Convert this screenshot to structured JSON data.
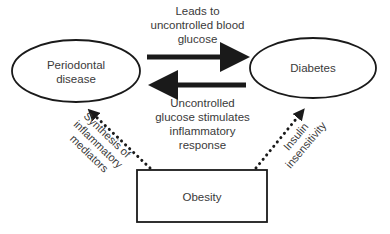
{
  "diagram": {
    "nodes": {
      "periodontal": {
        "line1": "Periodontal",
        "line2": "disease"
      },
      "diabetes": {
        "label": "Diabetes"
      },
      "obesity": {
        "label": "Obesity"
      }
    },
    "edges": {
      "periodontal_to_diabetes": {
        "line1": "Leads to",
        "line2": "uncontrolled blood",
        "line3": "glucose"
      },
      "diabetes_to_periodontal": {
        "line1": "Uncontrolled",
        "line2": "glucose stimulates",
        "line3": "inflammatory",
        "line4": "response"
      },
      "obesity_to_periodontal": {
        "line1": "Synthesis of",
        "line2": "inflammatory",
        "line3": "mediators"
      },
      "obesity_to_diabetes": {
        "line1": "Insulin",
        "line2": "insensitivity"
      }
    },
    "colors": {
      "stroke": "#1a1a1a",
      "text": "#3a3a3a",
      "background": "#ffffff"
    }
  }
}
